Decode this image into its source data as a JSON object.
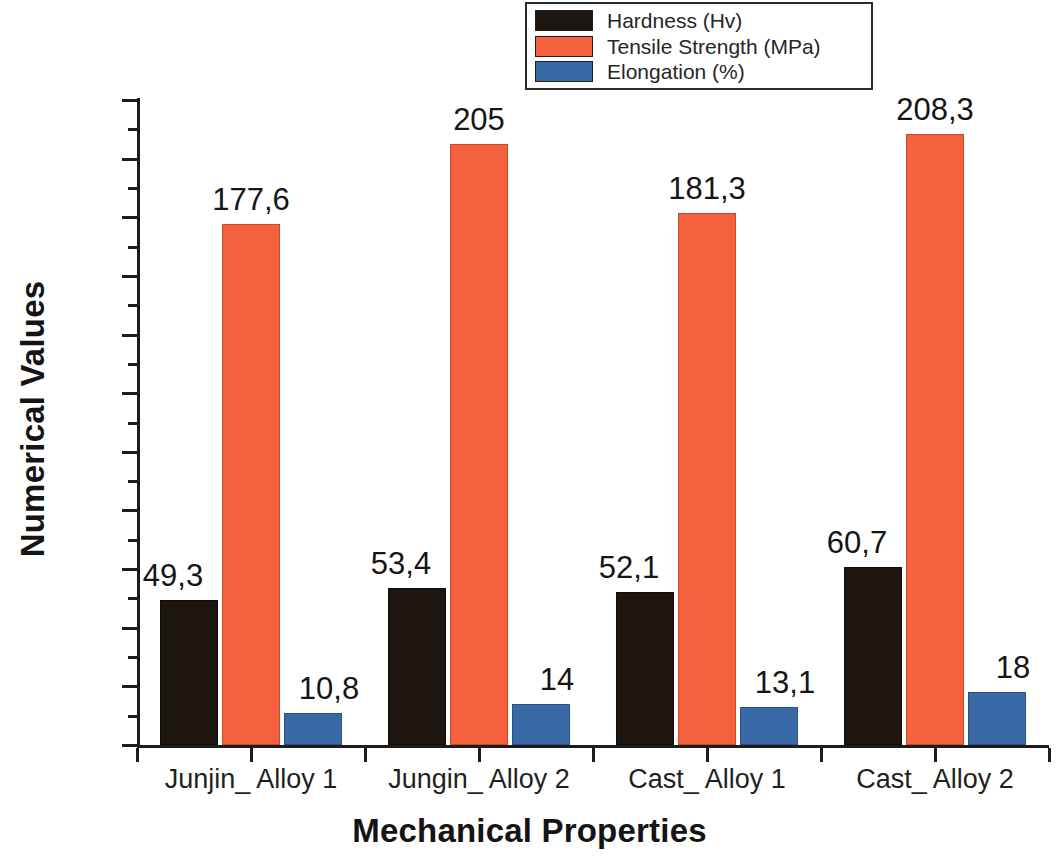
{
  "chart_data": {
    "type": "bar",
    "title": "",
    "xlabel": "Mechanical Properties",
    "ylabel": "Numerical Values",
    "ylim": [
      0,
      220
    ],
    "ytick_step": 20,
    "yminor_step": 10,
    "grid": false,
    "legend_position": "top-center",
    "categories": [
      "Junjin_ Alloy 1",
      "Jungin_ Alloy 2",
      "Cast_ Alloy 1",
      "Cast_ Alloy 2"
    ],
    "series": [
      {
        "name": "Hardness (Hv)",
        "color": "#1d1510",
        "values": [
          49.3,
          53.4,
          52.1,
          60.7
        ],
        "labels": [
          "49,3",
          "53,4",
          "52,1",
          "60,7"
        ]
      },
      {
        "name": "Tensile Strength (MPa)",
        "color": "#f4613c",
        "values": [
          177.6,
          205,
          181.3,
          208.3
        ],
        "labels": [
          "177,6",
          "205",
          "181,3",
          "208,3"
        ]
      },
      {
        "name": "Elongation (%)",
        "color": "#3a69a8",
        "values": [
          10.8,
          14,
          13.1,
          18
        ],
        "labels": [
          "10,8",
          "14",
          "13,1",
          "18"
        ]
      }
    ],
    "ytick_labels": [
      "220",
      "200",
      "180",
      "160",
      "140",
      "120",
      "100",
      "80",
      "60",
      "40",
      "20",
      "0"
    ]
  },
  "legend": {
    "items": [
      {
        "label": "Hardness (Hv)",
        "color": "#1d1510"
      },
      {
        "label": "Tensile Strength (MPa)",
        "color": "#f4613c"
      },
      {
        "label": "Elongation (%)",
        "color": "#3a69a8"
      }
    ]
  },
  "axes": {
    "y_title": "Numerical Values",
    "x_title": "Mechanical Properties"
  }
}
